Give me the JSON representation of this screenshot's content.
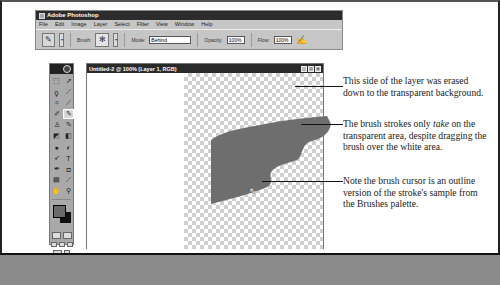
{
  "app_window": {
    "title": "Adobe Photoshop",
    "menu": [
      "File",
      "Edit",
      "Image",
      "Layer",
      "Select",
      "Filter",
      "View",
      "Window",
      "Help"
    ],
    "options_bar": {
      "brush_label": "Brush:",
      "mode_label": "Mode:",
      "mode_value": "Behind",
      "opacity_label": "Opacity:",
      "opacity_value": "100%",
      "flow_label": "Flow:",
      "flow_value": "100%",
      "tool_icon": "paintbrush-icon",
      "airbrush_icon": "airbrush-icon"
    }
  },
  "document": {
    "title": "Untitled-2 @ 100% (Layer 1, RGB)",
    "window_buttons": [
      "_",
      "□",
      "×"
    ]
  },
  "toolbox": {
    "tools": [
      "marquee",
      "move",
      "lasso",
      "magic-wand",
      "crop",
      "slice",
      "healing",
      "brush",
      "stamp",
      "history-brush",
      "eraser",
      "gradient",
      "blur",
      "dodge",
      "path-select",
      "type",
      "pen",
      "shape",
      "notes",
      "eyedropper",
      "hand",
      "zoom"
    ],
    "foreground_color": "#6a6a6a",
    "background_color": "#111111"
  },
  "callouts": [
    "This side of the layer was erased down to the transparent background.",
    "The brush strokes only take on the transparent area, despite dragging the brush over the white area.",
    "Note the brush cursor is an outline version of the stroke's sample from the Brushes palette."
  ],
  "callout_2_parts": {
    "before": "The brush strokes only ",
    "em": "take",
    "after": " on the transparent area, despite dragging the brush over the white area."
  }
}
